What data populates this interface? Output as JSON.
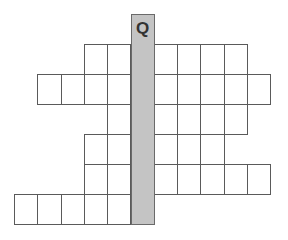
{
  "puzzle": {
    "type": "crossword-keyword",
    "key_column": {
      "letter": "Q",
      "color": "#c4c4c4",
      "rows": 7
    },
    "cell_width": 23.3,
    "cell_height": 30,
    "origin_x": 130.5,
    "origin_y": 14,
    "rows": [
      {
        "index": 0,
        "left_cells": 0,
        "right_cells": 0
      },
      {
        "index": 1,
        "left_cells": 2,
        "right_cells": 4
      },
      {
        "index": 2,
        "left_cells": 4,
        "right_cells": 5
      },
      {
        "index": 3,
        "left_cells": 1,
        "right_cells": 4
      },
      {
        "index": 4,
        "left_cells": 2,
        "right_cells": 3
      },
      {
        "index": 5,
        "left_cells": 2,
        "right_cells": 5
      },
      {
        "index": 6,
        "left_cells": 5,
        "right_cells": 0
      }
    ]
  }
}
